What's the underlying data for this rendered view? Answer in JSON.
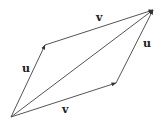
{
  "diagram": {
    "type": "vector-parallelogram",
    "colors": {
      "stroke": "#555555",
      "text": "#222222",
      "background": "#ffffff"
    },
    "points": {
      "origin": [
        11,
        117
      ],
      "top_left": [
        45,
        45
      ],
      "bottom_right": [
        116,
        83
      ],
      "top_right": [
        153,
        10
      ]
    },
    "vectors": [
      {
        "id": "u_left",
        "label": "u",
        "from": "origin",
        "to": "top_left"
      },
      {
        "id": "v_top",
        "label": "v",
        "from": "top_left",
        "to": "top_right"
      },
      {
        "id": "v_bottom",
        "label": "v",
        "from": "origin",
        "to": "bottom_right"
      },
      {
        "id": "u_right",
        "label": "u",
        "from": "bottom_right",
        "to": "top_right"
      },
      {
        "id": "sum",
        "label": "",
        "from": "origin",
        "to": "top_right"
      }
    ],
    "labels": {
      "u_left": "u",
      "v_top": "v",
      "v_bottom": "v",
      "u_right": "u"
    }
  }
}
